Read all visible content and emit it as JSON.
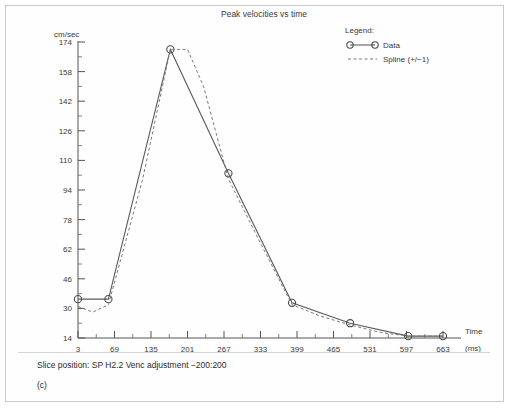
{
  "figure": {
    "panel_label": "(c)",
    "slice_info": "Slice position: SP H2.2  Venc adjustment −200:200"
  },
  "legend": {
    "heading": "Legend:",
    "entries": [
      {
        "label": "Data",
        "style": "solid-with-circles"
      },
      {
        "label": "Spline (+/−1)",
        "style": "dashed"
      }
    ]
  },
  "chart_data": {
    "type": "line",
    "title": "Peak velocities vs time",
    "xlabel": "Time",
    "xunit": "(ms)",
    "ylabel": "cm/sec",
    "ylim": [
      14,
      174
    ],
    "xlim": [
      3,
      663
    ],
    "grid": false,
    "legend_position": "top-right",
    "yticks": [
      14,
      30,
      46,
      62,
      78,
      94,
      110,
      126,
      142,
      158,
      174
    ],
    "xticks": [
      3,
      69,
      135,
      201,
      267,
      333,
      399,
      465,
      531,
      597,
      663
    ],
    "series": [
      {
        "name": "Data",
        "marker": "circle",
        "linestyle": "solid",
        "x": [
          3,
          58,
          170,
          275,
          390,
          495,
          600,
          663
        ],
        "values": [
          35,
          35,
          170,
          103,
          33,
          22,
          15,
          15
        ]
      },
      {
        "name": "Spline (+/−1)",
        "marker": "none",
        "linestyle": "dashed",
        "x": [
          3,
          30,
          58,
          120,
          170,
          201,
          230,
          275,
          330,
          390,
          440,
          495,
          550,
          600,
          663
        ],
        "values": [
          31,
          28,
          32,
          100,
          170,
          170,
          150,
          100,
          67,
          32,
          26,
          21,
          17,
          15,
          15
        ]
      }
    ]
  }
}
